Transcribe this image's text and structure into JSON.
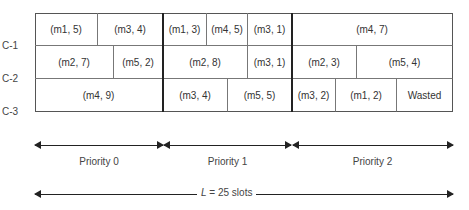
{
  "channels": [
    "C-1",
    "C-2",
    "C-3"
  ],
  "rows": [
    [
      {
        "label": "(m1, 5)",
        "x0": 35,
        "x1": 98
      },
      {
        "label": "(m3, 4)",
        "x0": 98,
        "x1": 163
      },
      {
        "label": "(m1, 3)",
        "x0": 163,
        "x1": 207
      },
      {
        "label": "(m4, 5)",
        "x0": 207,
        "x1": 248
      },
      {
        "label": "(m3, 1)",
        "x0": 248,
        "x1": 292
      },
      {
        "label": "(m4, 7)",
        "x0": 292,
        "x1": 453
      }
    ],
    [
      {
        "label": "(m2, 7)",
        "x0": 35,
        "x1": 114
      },
      {
        "label": "(m5, 2)",
        "x0": 114,
        "x1": 163
      },
      {
        "label": "(m2, 8)",
        "x0": 163,
        "x1": 248
      },
      {
        "label": "(m3, 1)",
        "x0": 248,
        "x1": 292
      },
      {
        "label": "(m2, 3)",
        "x0": 292,
        "x1": 357
      },
      {
        "label": "(m5, 4)",
        "x0": 357,
        "x1": 453
      }
    ],
    [
      {
        "label": "(m4, 9)",
        "x0": 35,
        "x1": 163
      },
      {
        "label": "(m3, 4)",
        "x0": 163,
        "x1": 228
      },
      {
        "label": "(m5, 5)",
        "x0": 228,
        "x1": 292
      },
      {
        "label": "(m3, 2)",
        "x0": 292,
        "x1": 336
      },
      {
        "label": "(m1, 2)",
        "x0": 336,
        "x1": 397
      },
      {
        "label": "Wasted",
        "x0": 397,
        "x1": 453
      }
    ]
  ],
  "priorities": [
    {
      "label": "Priority 0",
      "x0": 35,
      "x1": 163
    },
    {
      "label": "Priority 1",
      "x0": 163,
      "x1": 292
    },
    {
      "label": "Priority 2",
      "x0": 292,
      "x1": 453
    }
  ],
  "length_label": {
    "var": "L",
    "text": " = 25 slots"
  }
}
